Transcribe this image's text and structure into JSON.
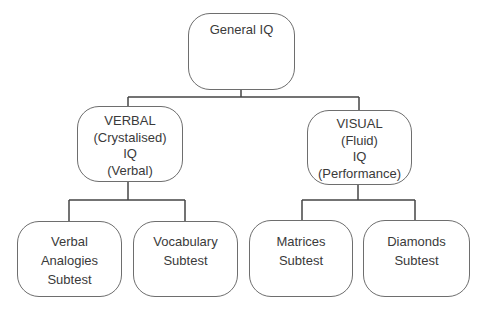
{
  "diagram": {
    "root": {
      "lines": [
        "General IQ"
      ]
    },
    "level2": [
      {
        "lines": [
          "VERBAL",
          "(Crystalised)",
          "IQ",
          "(Verbal)"
        ]
      },
      {
        "lines": [
          "VISUAL",
          "(Fluid)",
          "IQ",
          "(Performance)"
        ]
      }
    ],
    "level3": [
      {
        "lines": [
          "Verbal",
          "Analogies",
          "Subtest"
        ]
      },
      {
        "lines": [
          "Vocabulary",
          "Subtest"
        ]
      },
      {
        "lines": [
          "Matrices",
          "Subtest"
        ]
      },
      {
        "lines": [
          "Diamonds",
          "Subtest"
        ]
      }
    ],
    "colors": {
      "line": "#444444",
      "border": "#6e6e6e",
      "text": "#3a3a3a"
    }
  }
}
